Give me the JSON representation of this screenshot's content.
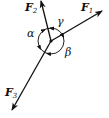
{
  "diagram": {
    "type": "force-vectors",
    "forces": [
      {
        "name": "F",
        "subscript": "1",
        "direction": "upper-right"
      },
      {
        "name": "F",
        "subscript": "2",
        "direction": "up-slightly-left"
      },
      {
        "name": "F",
        "subscript": "3",
        "direction": "lower-left"
      }
    ],
    "angles": [
      {
        "label": "γ",
        "between": "F1-F2"
      },
      {
        "label": "α",
        "between": "F2-F3"
      },
      {
        "label": "β",
        "between": "F3-F1"
      }
    ]
  }
}
